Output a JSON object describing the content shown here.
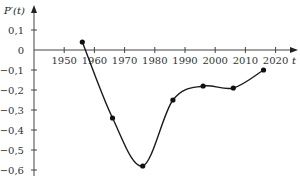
{
  "chart_data": {
    "type": "line",
    "title": "",
    "xlabel": "t",
    "ylabel": "P′(t)",
    "x": [
      1956,
      1966,
      1976,
      1986,
      1996,
      2006,
      2016
    ],
    "series": [
      {
        "name": "P′(t)",
        "values": [
          0.04,
          -0.34,
          -0.58,
          -0.25,
          -0.18,
          -0.19,
          -0.1
        ],
        "smooth": true,
        "markers": true
      }
    ],
    "x_ticks": [
      1950,
      1960,
      1970,
      1980,
      1990,
      2000,
      2010,
      2020
    ],
    "y_ticks": [
      0.1,
      0,
      -0.1,
      -0.2,
      -0.3,
      -0.4,
      -0.5,
      -0.6
    ],
    "y_tick_labels": [
      "0,1",
      "0",
      "−0,1",
      "−0,2",
      "−0,3",
      "−0,4",
      "−0,5",
      "−0,6"
    ],
    "xlim": [
      1940,
      2026
    ],
    "ylim": [
      -0.6,
      0.15
    ],
    "grid": false,
    "legend": "none"
  },
  "style": {
    "line_color": "#1a1a1a",
    "axis_color": "#444444"
  }
}
